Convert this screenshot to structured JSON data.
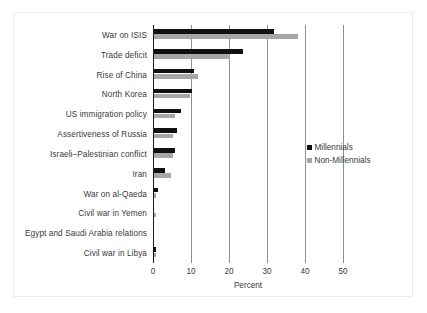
{
  "chart_data": {
    "type": "bar",
    "orientation": "horizontal",
    "title": "",
    "subtitle": "",
    "xlabel": "Percent",
    "ylabel": "",
    "xlim": [
      0,
      50
    ],
    "xticks": [
      0,
      10,
      20,
      30,
      40,
      50
    ],
    "xtick_labels": [
      "0",
      "10",
      "20",
      "30",
      "40",
      "50"
    ],
    "grid": "vertical gridlines at each x tick",
    "legend_position": "right, middle",
    "categories": [
      "War on ISIS",
      "Trade deficit",
      "Rise of China",
      "North Korea",
      "US immigration policy",
      "Assertiveness of Russia",
      "Israeli–Palestinian conflict",
      "Iran",
      "War on al-Qaeda",
      "Civil war in Yemen",
      "Egypt and Saudi Arabia relations",
      "Civil war in Libya"
    ],
    "series": [
      {
        "name": "Millennials",
        "color": "#111111",
        "values": [
          31.5,
          23.5,
          10.5,
          10.0,
          7.0,
          6.0,
          5.5,
          3.0,
          1.0,
          0.0,
          0.0,
          0.5
        ]
      },
      {
        "name": "Non-Millennials",
        "color": "#a6a6a6",
        "values": [
          38.0,
          20.0,
          11.5,
          9.5,
          5.5,
          5.0,
          5.0,
          4.5,
          0.5,
          0.5,
          0.0,
          0.5
        ]
      }
    ]
  },
  "legend": {
    "items": [
      {
        "label": "Millennials",
        "color": "#111111"
      },
      {
        "label": "Non-Millennials",
        "color": "#a6a6a6"
      }
    ]
  },
  "axis": {
    "x_title": "Percent"
  }
}
